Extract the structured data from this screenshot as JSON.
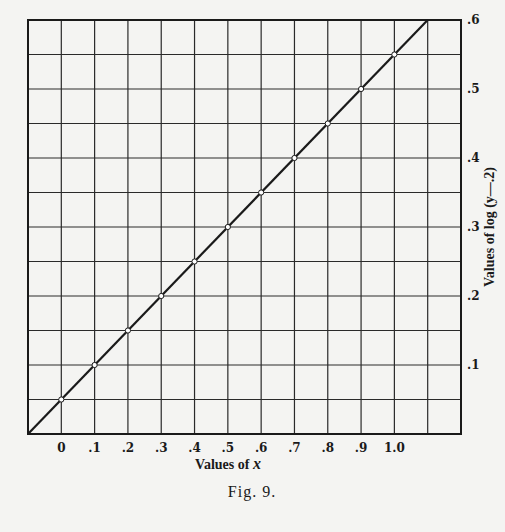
{
  "chart_data": {
    "type": "line",
    "title": "",
    "caption": "Fig. 9.",
    "xlabel_prefix": "Values of",
    "xlabel_var": "x",
    "ylabel": "Values of log (y—.2)",
    "xlim": [
      -0.1,
      1.2
    ],
    "ylim": [
      0,
      0.6
    ],
    "grid": true,
    "x_grid_step": 0.1,
    "y_grid_step": 0.05,
    "x_ticks": [
      {
        "value": 0,
        "label": "0"
      },
      {
        "value": 0.1,
        "label": ".1"
      },
      {
        "value": 0.2,
        "label": ".2"
      },
      {
        "value": 0.3,
        "label": ".3"
      },
      {
        "value": 0.4,
        "label": ".4"
      },
      {
        "value": 0.5,
        "label": ".5"
      },
      {
        "value": 0.6,
        "label": ".6"
      },
      {
        "value": 0.7,
        "label": ".7"
      },
      {
        "value": 0.8,
        "label": ".8"
      },
      {
        "value": 0.9,
        "label": ".9"
      },
      {
        "value": 1.0,
        "label": "1.0"
      }
    ],
    "y_ticks": [
      {
        "value": 0.1,
        "label": ".1"
      },
      {
        "value": 0.2,
        "label": ".2"
      },
      {
        "value": 0.3,
        "label": ".3"
      },
      {
        "value": 0.4,
        "label": ".4"
      },
      {
        "value": 0.5,
        "label": ".5"
      },
      {
        "value": 0.6,
        "label": ".6"
      }
    ],
    "y_axis_side": "right",
    "series": [
      {
        "name": "log(y-.2)",
        "x": [
          0,
          0.1,
          0.2,
          0.3,
          0.4,
          0.5,
          0.6,
          0.7,
          0.8,
          0.9,
          1.0
        ],
        "y": [
          0.05,
          0.1,
          0.15,
          0.2,
          0.25,
          0.3,
          0.35,
          0.4,
          0.45,
          0.5,
          0.55
        ]
      }
    ],
    "fit_line": {
      "slope": 0.5,
      "intercept": 0.05
    }
  }
}
